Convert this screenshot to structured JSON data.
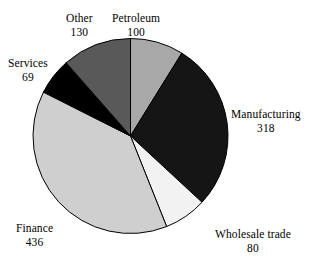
{
  "chart_data": {
    "type": "pie",
    "title": "",
    "subtitle": "",
    "xlabel": "",
    "ylabel": "",
    "legend_position": "none",
    "grid": false,
    "total": 1133,
    "start_angle_deg": 0,
    "direction": "clockwise",
    "categories": [
      "Petroleum",
      "Manufacturing",
      "Wholesale trade",
      "Finance",
      "Services",
      "Other"
    ],
    "values": [
      100,
      318,
      80,
      436,
      69,
      130
    ],
    "slices": [
      {
        "label": "Petroleum",
        "value": 100,
        "value_text": "100",
        "color": "#a8a8a8",
        "label_position": "top-center"
      },
      {
        "label": "Manufacturing",
        "value": 318,
        "value_text": "318",
        "color": "#151515",
        "label_position": "right"
      },
      {
        "label": "Wholesale trade",
        "value": 80,
        "value_text": "80",
        "color": "#f2f2f2",
        "label_position": "bottom-right"
      },
      {
        "label": "Finance",
        "value": 436,
        "value_text": "436",
        "color": "#cfcfcf",
        "label_position": "bottom-left"
      },
      {
        "label": "Services",
        "value": 69,
        "value_text": "69",
        "color": "#000000",
        "label_position": "left"
      },
      {
        "label": "Other",
        "value": 130,
        "value_text": "130",
        "color": "#595959",
        "label_position": "top-left"
      }
    ],
    "stroke_color": "#000000",
    "background_color": "#ffffff"
  }
}
